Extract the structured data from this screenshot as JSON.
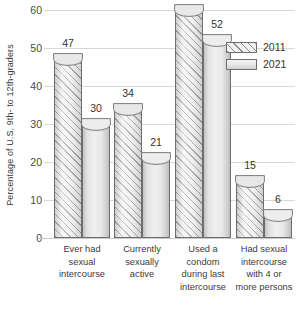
{
  "chart_data": {
    "type": "bar",
    "title": "",
    "subtitle": "",
    "xlabel": "",
    "ylabel": "Percentage of U.S. 9th- to 12th-graders",
    "ylim": [
      0,
      60
    ],
    "yticks": [
      0,
      10,
      20,
      30,
      40,
      50,
      60
    ],
    "ytick_labels": [
      "0",
      "10",
      "20",
      "30",
      "40",
      "50",
      "60"
    ],
    "grid": true,
    "legend_position": "top-right",
    "categories": [
      "Ever had sexual intercourse",
      "Currently sexually active",
      "Used a condom during last intercourse",
      "Had sexual intercourse with 4 or more persons"
    ],
    "category_lines": [
      [
        "Ever had",
        "sexual",
        "intercourse"
      ],
      [
        "Currently",
        "sexually",
        "active"
      ],
      [
        "Used a",
        "condom",
        "during last",
        "intercourse"
      ],
      [
        "Had sexual",
        "intercourse",
        "with 4 or",
        "more persons"
      ]
    ],
    "series": [
      {
        "name": "2011",
        "values": [
          47,
          34,
          60,
          15
        ],
        "fill": "hatched",
        "color": "#ececec"
      },
      {
        "name": "2021",
        "values": [
          30,
          21,
          52,
          6
        ],
        "fill": "solid",
        "color": "#e6e6e6"
      }
    ],
    "data_labels": [
      [
        "47",
        "30"
      ],
      [
        "34",
        "21"
      ],
      [
        "60",
        "52"
      ],
      [
        "15",
        "6"
      ]
    ]
  },
  "legend": {
    "items": [
      {
        "label": "2011"
      },
      {
        "label": "2021"
      }
    ]
  },
  "colors": {
    "gridline": "#d8d8d8",
    "bar_outline": "#6e6e6e",
    "text": "#333333",
    "axis_text": "#4a4a4a",
    "background": "#ffffff"
  }
}
